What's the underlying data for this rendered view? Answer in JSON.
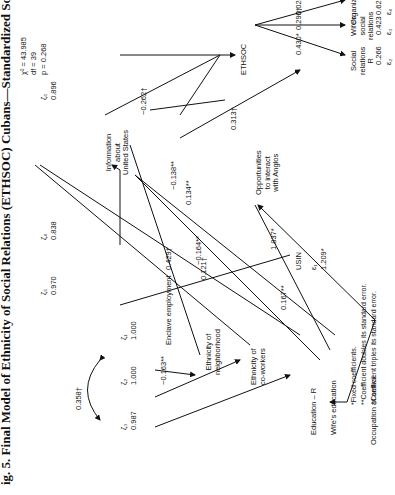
{
  "title": "ig. 5.   Final Model of Ethnicity of Social Relations (ETHSOC) Cubans—Standardized Solution",
  "fit": {
    "chi2": "χ² = 43.985",
    "df": "df = 39",
    "p": "p = 0.268"
  },
  "nodes": {
    "enclave": "Enclave employment",
    "neigh1": "Ethnicity of",
    "neigh2": "neighborhood",
    "cowork1": "Ethnicity of",
    "cowork2": "co-workers",
    "educ": "Education – R",
    "wifeedu": "Wife's education",
    "occ": "Occupation at arrival",
    "info1": "Information",
    "info2": "about",
    "info3": "United States",
    "opp1": "Opportunities",
    "opp2": "to interact",
    "opp3": "with Anglos",
    "ethsoc": "ETHSOC",
    "usin": "USIN",
    "soc1": "Social",
    "soc2": "relations",
    "soc3": "R",
    "wife1": "Wife's",
    "wife2": "social",
    "wife3": "relations",
    "org": "Organizations"
  },
  "errors": {
    "z1": "ζ₁",
    "z2": "ζ₂",
    "z3": "ζ₃",
    "z4": "ζ₄",
    "z5": "ζ₅",
    "z6": "ζ₆",
    "e1": "ε₁",
    "e2": "ε₂",
    "e3": "ε₃",
    "e4": "ε₄",
    "z1v": "1.000",
    "z2v": "1.000",
    "z3v": "0.987",
    "z4v": "0.838",
    "z5v": "0.970",
    "z6v": "0.896",
    "e1v": "1.209*",
    "e2v": "0.266",
    "e3v": "0.423",
    "e4v": "0.627"
  },
  "coefficients": {
    "corr": "0.358†",
    "ethsoc_soc": "0.430*",
    "ethsoc_wife": "0.290†",
    "ethsoc_org": "0.028",
    "info_ethsoc": "−0.262†",
    "opp_ethsoc": "0.313†",
    "neigh_info": "−0.138**",
    "cowork_info": "0.134**",
    "cowork_opp": "−0.164**",
    "occ_opp": "0.167**",
    "educ_info": "0.429†",
    "wifeedu_info": "0.121†",
    "occ_cowork": "−0.163**",
    "usin": "1.837*"
  },
  "notes": [
    "*Fixed coefficients.",
    "**Coefficient doubles its standard error.",
    "†Coefficient triples its standard error."
  ]
}
